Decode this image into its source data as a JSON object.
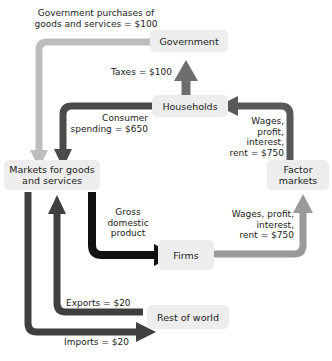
{
  "diagram": {
    "type": "circular-flow",
    "nodes": [
      {
        "id": "government",
        "label": "Government"
      },
      {
        "id": "households",
        "label": "Households"
      },
      {
        "id": "markets_goods",
        "label": "Markets for goods\nand services"
      },
      {
        "id": "factor_markets",
        "label": "Factor\nmarkets"
      },
      {
        "id": "firms",
        "label": "Firms"
      },
      {
        "id": "rest_of_world",
        "label": "Rest of world"
      }
    ],
    "flows": [
      {
        "id": "government_purchases",
        "label": "Government purchases of\ngoods and services = $100",
        "from": "government",
        "to": "markets_goods",
        "amount": 100,
        "color": "#bdbdbd"
      },
      {
        "id": "taxes",
        "label": "Taxes = $100",
        "from": "households",
        "to": "government",
        "amount": 100,
        "color": "#6e6e6e"
      },
      {
        "id": "consumer_spending",
        "label": "Consumer\nspending = $650",
        "from": "households",
        "to": "markets_goods",
        "amount": 650,
        "color": "#4a4a4a"
      },
      {
        "id": "wages_to_households",
        "label": "Wages,\nprofit,\ninterest,\nrent = $750",
        "from": "factor_markets",
        "to": "households",
        "amount": 750,
        "color": "#595959"
      },
      {
        "id": "wages_from_firms",
        "label": "Wages, profit,\ninterest,\nrent = $750",
        "from": "firms",
        "to": "factor_markets",
        "amount": 750,
        "color": "#9a9a9a"
      },
      {
        "id": "gross_domestic_product",
        "label": "Gross\ndomestic\nproduct",
        "from": "markets_goods",
        "to": "firms",
        "color": "#111111"
      },
      {
        "id": "exports",
        "label": "Exports = $20",
        "from": "rest_of_world",
        "to": "markets_goods",
        "amount": 20,
        "color": "#3f3f3f"
      },
      {
        "id": "imports",
        "label": "Imports = $20",
        "from": "markets_goods",
        "to": "rest_of_world",
        "amount": 20,
        "color": "#3f3f3f"
      }
    ]
  }
}
